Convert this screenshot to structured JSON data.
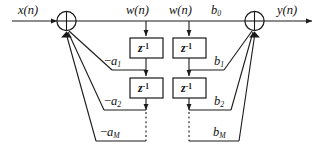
{
  "figure": {
    "type": "signal-flow-diagram",
    "background_color": "#ffffff",
    "line_color": "#1a1a1a"
  },
  "signals": {
    "input": "x(n)",
    "output": "y(n)",
    "state_left": "w(n)",
    "state_right": "w(n)"
  },
  "nodes": {
    "left_adder": {
      "symbol": "circle-cross",
      "name": "input-summing-junction"
    },
    "right_adder": {
      "symbol": "circle-cross",
      "name": "output-summing-junction"
    }
  },
  "delay_blocks": [
    {
      "id": "z-left-1",
      "label_base": "z",
      "label_exp": "-1",
      "column": "left",
      "row": 1
    },
    {
      "id": "z-right-1",
      "label_base": "z",
      "label_exp": "-1",
      "column": "right",
      "row": 1
    },
    {
      "id": "z-left-2",
      "label_base": "z",
      "label_exp": "-1",
      "column": "left",
      "row": 2
    },
    {
      "id": "z-right-2",
      "label_base": "z",
      "label_exp": "-1",
      "column": "right",
      "row": 2
    }
  ],
  "feedback_coefficients": [
    {
      "id": "a1",
      "sign": "−",
      "base": "a",
      "sub": "1",
      "row": 1
    },
    {
      "id": "a2",
      "sign": "−",
      "base": "a",
      "sub": "2",
      "row": 2
    },
    {
      "id": "aM",
      "sign": "−",
      "base": "a",
      "sub": "M",
      "row": 3
    }
  ],
  "feedforward_coefficients": [
    {
      "id": "b0",
      "sign": "",
      "base": "b",
      "sub": "0",
      "row": 0
    },
    {
      "id": "b1",
      "sign": "",
      "base": "b",
      "sub": "1",
      "row": 1
    },
    {
      "id": "b2",
      "sign": "",
      "base": "b",
      "sub": "2",
      "row": 2
    },
    {
      "id": "bM",
      "sign": "",
      "base": "b",
      "sub": "M",
      "row": 3
    }
  ],
  "ellipsis": {
    "left_column": "vertical-dashed",
    "right_column": "vertical-dashed"
  }
}
